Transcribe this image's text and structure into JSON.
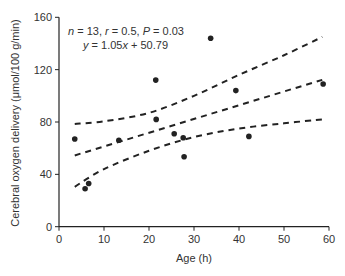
{
  "chart_data": {
    "type": "scatter",
    "title": "",
    "xlabel": "Age (h)",
    "ylabel": "Cerebral oxygen delivery (μmol/100 g/min)",
    "xlim": [
      0,
      60
    ],
    "ylim": [
      0,
      160
    ],
    "xticks": [
      0,
      10,
      20,
      30,
      40,
      50,
      60
    ],
    "yticks": [
      0,
      40,
      80,
      120,
      160
    ],
    "grid": false,
    "legend": null,
    "annotations": [
      {
        "text_parts": [
          [
            "n",
            true
          ],
          [
            " = 13, ",
            false
          ],
          [
            "r",
            true
          ],
          [
            " = 0.5, ",
            false
          ],
          [
            "P",
            true
          ],
          [
            " = 0.03",
            false
          ]
        ],
        "text": "n = 13, r = 0.5, P = 0.03"
      },
      {
        "text_parts": [
          [
            "y",
            true
          ],
          [
            " = 1.05",
            false
          ],
          [
            "x",
            true
          ],
          [
            " + 50.79",
            false
          ]
        ],
        "text": "y = 1.05x + 50.79"
      }
    ],
    "series": [
      {
        "name": "observations",
        "kind": "scatter",
        "points": [
          [
            3.5,
            67
          ],
          [
            5.8,
            29
          ],
          [
            6.6,
            33
          ],
          [
            13.3,
            66
          ],
          [
            21.5,
            112
          ],
          [
            21.6,
            82
          ],
          [
            25.6,
            71
          ],
          [
            27.6,
            68
          ],
          [
            27.8,
            53.5
          ],
          [
            33.7,
            144
          ],
          [
            39.3,
            104
          ],
          [
            42.2,
            69
          ],
          [
            58.7,
            109
          ]
        ]
      },
      {
        "name": "regression",
        "kind": "line",
        "style": "dashed",
        "slope": 1.05,
        "intercept": 50.79,
        "x_range": [
          3.5,
          58.5
        ]
      },
      {
        "name": "upper 95% CI",
        "kind": "curve",
        "style": "dashed",
        "points": [
          [
            3.5,
            78.5
          ],
          [
            10,
            80.5
          ],
          [
            20,
            87
          ],
          [
            30,
            100
          ],
          [
            40,
            116
          ],
          [
            50,
            131
          ],
          [
            58.5,
            145
          ]
        ]
      },
      {
        "name": "lower 95% CI",
        "kind": "curve",
        "style": "dashed",
        "points": [
          [
            3.5,
            30.5
          ],
          [
            10,
            44
          ],
          [
            20,
            58
          ],
          [
            30,
            68.5
          ],
          [
            40,
            75
          ],
          [
            50,
            79
          ],
          [
            58.5,
            82
          ]
        ]
      }
    ]
  },
  "colors": {
    "ink": "#222222",
    "text": "#333333",
    "background": "#ffffff"
  },
  "layout": {
    "x0_px": 59,
    "x1_px": 329,
    "y0_px": 226.7,
    "y1_px": 17.3
  }
}
